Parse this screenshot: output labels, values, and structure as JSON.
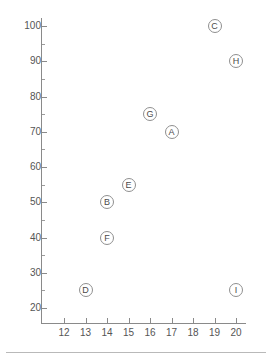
{
  "chart_data": {
    "type": "scatter",
    "title": "",
    "subtitle": "",
    "xlabel": "",
    "ylabel": "",
    "xlim": [
      11.5,
      20.5
    ],
    "ylim": [
      18,
      103
    ],
    "grid": false,
    "legend": "none",
    "x_ticks": [
      12,
      13,
      14,
      15,
      16,
      17,
      18,
      19,
      20
    ],
    "x_tick_labels": [
      "12",
      "13",
      "14",
      "15",
      "16",
      "17",
      "18",
      "19",
      "20"
    ],
    "y_ticks": [
      20,
      30,
      40,
      50,
      60,
      70,
      80,
      90,
      100
    ],
    "y_tick_labels": [
      "20",
      "30",
      "40",
      "50",
      "60",
      "70",
      "80",
      "90",
      "100"
    ],
    "y_minor_ticks": [
      25,
      35,
      45,
      55,
      65,
      75,
      85,
      95
    ],
    "marker_style": "open-circle-with-letter",
    "marker_color": "#8f8f8f",
    "points": [
      {
        "label": "A",
        "x": 17,
        "y": 70
      },
      {
        "label": "B",
        "x": 14,
        "y": 50
      },
      {
        "label": "C",
        "x": 19,
        "y": 100
      },
      {
        "label": "D",
        "x": 13,
        "y": 25
      },
      {
        "label": "E",
        "x": 15,
        "y": 55
      },
      {
        "label": "F",
        "x": 14,
        "y": 40
      },
      {
        "label": "G",
        "x": 16,
        "y": 75
      },
      {
        "label": "H",
        "x": 20,
        "y": 90
      },
      {
        "label": "I",
        "x": 20,
        "y": 25
      }
    ]
  },
  "colors": {
    "axis": "#8a8a8a",
    "tick_text": "#555555",
    "marker_outline": "#8f8f8f",
    "marker_text": "#4a4a4a",
    "background": "#ffffff",
    "rule": "#b9b9b9"
  }
}
